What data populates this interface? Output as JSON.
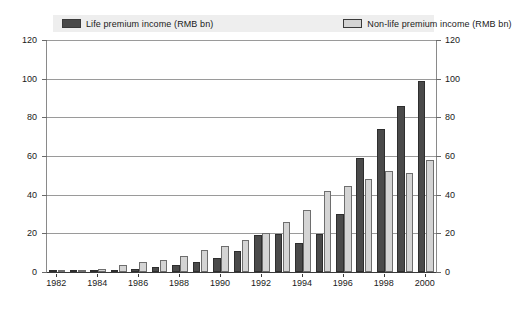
{
  "legend": {
    "items": [
      {
        "label": "Life premium income (RMB bn)",
        "swatch": "dark-swatch-icon",
        "color": "#4a4a4a"
      },
      {
        "label": "Non-life premium income (RMB bn)",
        "swatch": "light-swatch-icon",
        "color": "#d4d4d4"
      }
    ]
  },
  "chart_data": {
    "type": "bar",
    "title": "",
    "subtitle": "",
    "xlabel": "",
    "ylabel": "",
    "ylim": [
      0,
      120
    ],
    "ytick_step": 20,
    "yticks": [
      0,
      20,
      40,
      60,
      80,
      100,
      120
    ],
    "ytick_labels": [
      "0",
      "20",
      "40",
      "60",
      "80",
      "100",
      "120"
    ],
    "right_axis": true,
    "right_ytick_labels": [
      "0",
      "20",
      "40",
      "60",
      "80",
      "100",
      "120"
    ],
    "grid": true,
    "legend_position": "top",
    "categories": [
      "1982",
      "1983",
      "1984",
      "1985",
      "1986",
      "1987",
      "1988",
      "1989",
      "1990",
      "1991",
      "1992",
      "1993",
      "1994",
      "1995",
      "1996",
      "1997",
      "1998",
      "1999",
      "2000"
    ],
    "xtick_labels": [
      "1982",
      "1984",
      "1986",
      "1988",
      "1990",
      "1992",
      "1994",
      "1996",
      "1998",
      "2000"
    ],
    "series": [
      {
        "name": "Life premium income (RMB bn)",
        "color": "#4a4a4a",
        "values": [
          0.2,
          0.3,
          0.4,
          0.8,
          1.5,
          2.5,
          3.5,
          5.0,
          7.0,
          11.0,
          19.0,
          19.5,
          15.0,
          19.5,
          30.0,
          59.0,
          74.0,
          86.0,
          99.0
        ]
      },
      {
        "name": "Non-life premium income (RMB bn)",
        "color": "#d4d4d4",
        "values": [
          0.5,
          1.2,
          1.5,
          3.5,
          5.0,
          6.0,
          8.5,
          11.5,
          13.5,
          16.5,
          20.0,
          26.0,
          32.0,
          42.0,
          44.5,
          48.0,
          52.0,
          51.0,
          58.0
        ]
      }
    ]
  }
}
